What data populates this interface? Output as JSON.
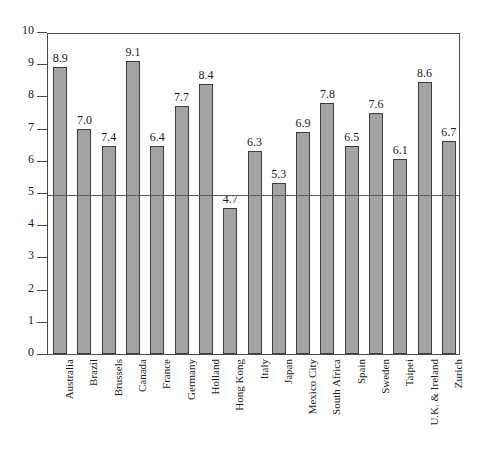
{
  "chart_data": {
    "type": "bar",
    "title": "",
    "subtitle": "",
    "xlabel": "",
    "ylabel": "",
    "ylim": [
      0,
      10
    ],
    "ytick_labels": [
      "0",
      "1",
      "2",
      "3",
      "4",
      "5",
      "6",
      "7",
      "8",
      "9",
      "10"
    ],
    "ytick_values": [
      0,
      1,
      2,
      3,
      4,
      5,
      6,
      7,
      8,
      9,
      10
    ],
    "grid": false,
    "legend": "none",
    "reference_line": {
      "axis": "y",
      "value": 5,
      "label": ""
    },
    "categories": [
      "Australia",
      "Brazil",
      "Brussels",
      "Canada",
      "France",
      "Germany",
      "Holland",
      "Hong Kong",
      "Italy",
      "Japan",
      "Mexico City",
      "South Africa",
      "Spain",
      "Sweden",
      "Taipei",
      "U.K. & Ireland",
      "Zurich"
    ],
    "values": [
      8.9,
      7.0,
      7.4,
      9.1,
      6.4,
      7.7,
      8.4,
      4.7,
      6.3,
      5.3,
      6.9,
      7.8,
      6.5,
      7.6,
      6.1,
      8.6,
      6.7
    ],
    "value_labels": [
      "8.9",
      "7.0",
      "7.4",
      "9.1",
      "6.4",
      "7.7",
      "8.4",
      "4.7",
      "6.3",
      "5.3",
      "6.9",
      "7.8",
      "6.5",
      "7.6",
      "6.1",
      "8.6",
      "6.7"
    ],
    "drawn_heights": [
      8.9,
      7.0,
      6.45,
      9.1,
      6.45,
      7.7,
      8.4,
      4.55,
      6.3,
      5.3,
      6.9,
      7.8,
      6.45,
      7.5,
      6.05,
      8.45,
      6.6
    ],
    "colors": {
      "bar_fill": "#a3a3a3",
      "bar_border": "#3d3d3d",
      "axis": "#4a4a4a",
      "reference_line": "#5a5a5a",
      "text": "#1a1a1a",
      "background": "#ffffff"
    }
  }
}
